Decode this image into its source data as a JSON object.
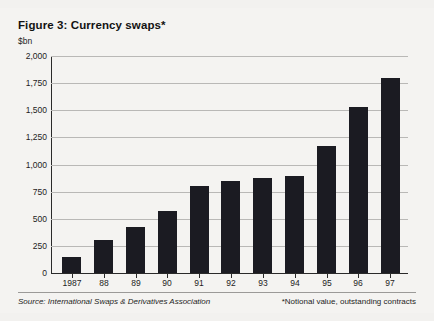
{
  "figure": {
    "title": "Figure 3: Currency swaps*",
    "unit_label": "$bn",
    "source": "Source: International Swaps & Derivatives Association",
    "note": "*Notional value, outstanding contracts",
    "background": "#f4f3f1",
    "bar_color": "#1b1b22",
    "grid_color": "#b9b8b6"
  },
  "chart_data": {
    "type": "bar",
    "title": "Figure 3: Currency swaps*",
    "xlabel": "",
    "ylabel": "$bn",
    "ylim": [
      0,
      2000
    ],
    "yticks": [
      0,
      250,
      500,
      750,
      1000,
      1250,
      1500,
      1750,
      2000
    ],
    "ytick_labels": [
      "0",
      "250",
      "500",
      "750",
      "1,000",
      "1,250",
      "1,500",
      "1,750",
      "2,000"
    ],
    "grid": true,
    "legend": null,
    "categories": [
      "1987",
      "88",
      "89",
      "90",
      "91",
      "92",
      "93",
      "94",
      "95",
      "96",
      "97"
    ],
    "values": [
      150,
      300,
      420,
      570,
      800,
      850,
      880,
      890,
      1170,
      1530,
      1800
    ],
    "annotations": [
      "Source: International Swaps & Derivatives Association",
      "*Notional value, outstanding contracts"
    ]
  }
}
